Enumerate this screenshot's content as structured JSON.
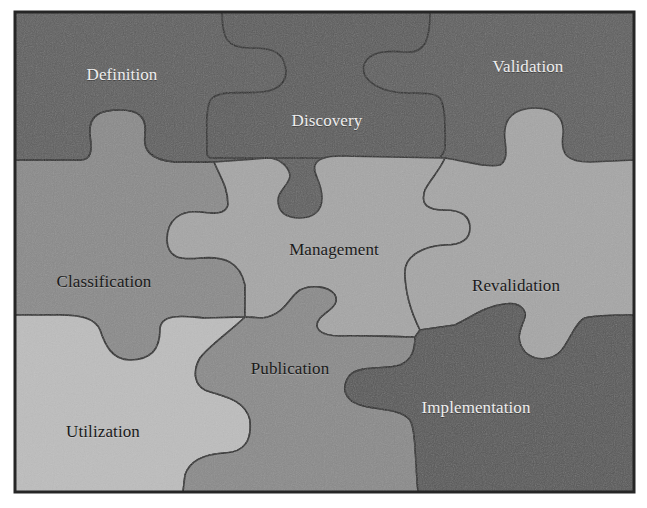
{
  "diagram": {
    "type": "jigsaw-puzzle",
    "colors": {
      "dark": "#5e5e5e",
      "mid": "#8a8a8a",
      "light": "#a6a6a6",
      "lightest": "#bdbdbd",
      "outline": "#2a2a2a",
      "text_light": "#eeeeee",
      "text_dark": "#1a1a1a"
    },
    "pieces": [
      {
        "id": "definition",
        "label": "Definition",
        "row": 1,
        "col": 1,
        "shade": "dark"
      },
      {
        "id": "discovery",
        "label": "Discovery",
        "row": 1,
        "col": 2,
        "shade": "dark"
      },
      {
        "id": "validation",
        "label": "Validation",
        "row": 1,
        "col": 3,
        "shade": "dark"
      },
      {
        "id": "classification",
        "label": "Classification",
        "row": 2,
        "col": 1,
        "shade": "mid"
      },
      {
        "id": "management",
        "label": "Management",
        "row": 2,
        "col": 2,
        "shade": "light"
      },
      {
        "id": "revalidation",
        "label": "Revalidation",
        "row": 2,
        "col": 3,
        "shade": "light"
      },
      {
        "id": "utilization",
        "label": "Utilization",
        "row": 3,
        "col": 1,
        "shade": "lightest"
      },
      {
        "id": "publication",
        "label": "Publication",
        "row": 3,
        "col": 2,
        "shade": "mid"
      },
      {
        "id": "implementation",
        "label": "Implementation",
        "row": 3,
        "col": 3,
        "shade": "dark"
      }
    ]
  }
}
